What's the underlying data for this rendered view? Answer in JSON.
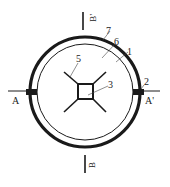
{
  "diagram": {
    "type": "cross-section",
    "colors": {
      "stroke": "#1a1a1a",
      "background": "#ffffff",
      "label": "#222222"
    },
    "section_marks": {
      "left": "A",
      "right": "A'",
      "top": "B'",
      "bottom": "B"
    },
    "callouts": [
      {
        "id": "1",
        "label": "1"
      },
      {
        "id": "2",
        "label": "2"
      },
      {
        "id": "3",
        "label": "3"
      },
      {
        "id": "5",
        "label": "5"
      },
      {
        "id": "6",
        "label": "6"
      },
      {
        "id": "7",
        "label": "7"
      }
    ]
  }
}
